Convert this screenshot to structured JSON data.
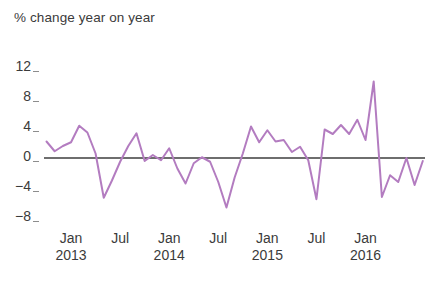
{
  "chart_data": {
    "type": "line",
    "title": "% change year on year",
    "xlabel": "",
    "ylabel": "",
    "ylim": [
      -10,
      12
    ],
    "yticks": [
      12,
      8,
      4,
      0,
      -4,
      -8
    ],
    "ytick_labels": [
      "12",
      "8",
      "4",
      "0",
      "−4",
      "−8"
    ],
    "grid": false,
    "legend": null,
    "zero_line": 0,
    "series_color": "#b37cc0",
    "zero_line_color": "#6e6e6e",
    "x_major_ticks": [
      {
        "label": "Jan",
        "sublabel": "2013",
        "x": 3
      },
      {
        "label": "Jul",
        "sublabel": "",
        "x": 9
      },
      {
        "label": "Jan",
        "sublabel": "2014",
        "x": 15
      },
      {
        "label": "Jul",
        "sublabel": "",
        "x": 21
      },
      {
        "label": "Jan",
        "sublabel": "2015",
        "x": 27
      },
      {
        "label": "Jul",
        "sublabel": "",
        "x": 33
      },
      {
        "label": "Jan",
        "sublabel": "2016",
        "x": 39
      }
    ],
    "x": [
      0,
      1,
      2,
      3,
      4,
      5,
      6,
      7,
      8,
      9,
      10,
      11,
      12,
      13,
      14,
      15,
      16,
      17,
      18,
      19,
      20,
      21,
      22,
      23,
      24,
      25,
      26,
      27,
      28,
      29,
      30,
      31,
      32,
      33,
      34,
      35,
      36,
      37,
      38,
      39,
      40,
      41,
      42,
      43,
      44,
      45,
      46
    ],
    "series": [
      {
        "name": "% change year on year",
        "values": [
          2.2,
          0.9,
          1.6,
          2.1,
          4.3,
          3.4,
          0.6,
          -5.3,
          -3.0,
          -0.5,
          1.6,
          3.3,
          -0.4,
          0.4,
          -0.3,
          1.3,
          -1.4,
          -3.4,
          -0.7,
          0.1,
          -0.5,
          -3.2,
          -6.6,
          -2.6,
          0.6,
          4.2,
          2.1,
          3.7,
          2.2,
          2.4,
          0.8,
          1.5,
          -0.3,
          -5.5,
          3.8,
          3.2,
          4.4,
          3.2,
          5.1,
          2.4,
          10.2,
          -5.2,
          -2.3,
          -3.2,
          0.0,
          -3.6,
          -0.4
        ]
      }
    ]
  },
  "axis": {
    "title_text": "% change year on year"
  }
}
